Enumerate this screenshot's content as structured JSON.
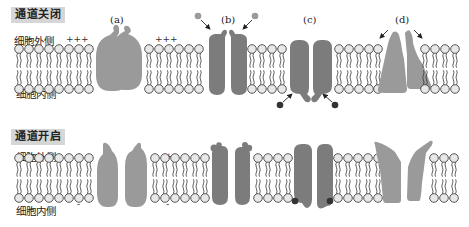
{
  "panels": [
    {
      "title": "通道关闭",
      "outside_label": "细胞外侧",
      "inside_label": "细胞内侧",
      "charges": [
        {
          "text": "+++",
          "position": "outside-left"
        },
        {
          "text": "—",
          "position": "inside-left"
        },
        {
          "text": "+++",
          "position": "outside-middle"
        },
        {
          "text": "—",
          "position": "inside-middle"
        }
      ],
      "channels": [
        {
          "label": "(a)",
          "type": "voltage-gated",
          "state": "closed"
        },
        {
          "label": "(b)",
          "type": "ligand-gated-extracellular",
          "state": "closed"
        },
        {
          "label": "(c)",
          "type": "ligand-gated-intracellular",
          "state": "closed"
        },
        {
          "label": "(d)",
          "type": "mechanically-gated",
          "state": "closed"
        }
      ]
    },
    {
      "title": "通道开启",
      "outside_label": "细胞外侧",
      "inside_label": "细胞内侧",
      "charges": [
        {
          "text": "+",
          "position": "outside-left"
        },
        {
          "text": "-",
          "position": "inside-left"
        },
        {
          "text": "+",
          "position": "outside-middle"
        },
        {
          "text": "-",
          "position": "inside-middle"
        }
      ],
      "channels": [
        {
          "type": "voltage-gated",
          "state": "open"
        },
        {
          "type": "ligand-gated-extracellular",
          "state": "open"
        },
        {
          "type": "ligand-gated-intracellular",
          "state": "open"
        },
        {
          "type": "mechanically-gated",
          "state": "open"
        }
      ]
    }
  ],
  "colors": {
    "channel_light": "#9a9a9a",
    "channel_dark": "#7c7c7c",
    "lipid_head": "#e8e8e8",
    "ligand_light": "#999999",
    "ligand_dark": "#333333",
    "title_bg": "#d6d6d6"
  }
}
